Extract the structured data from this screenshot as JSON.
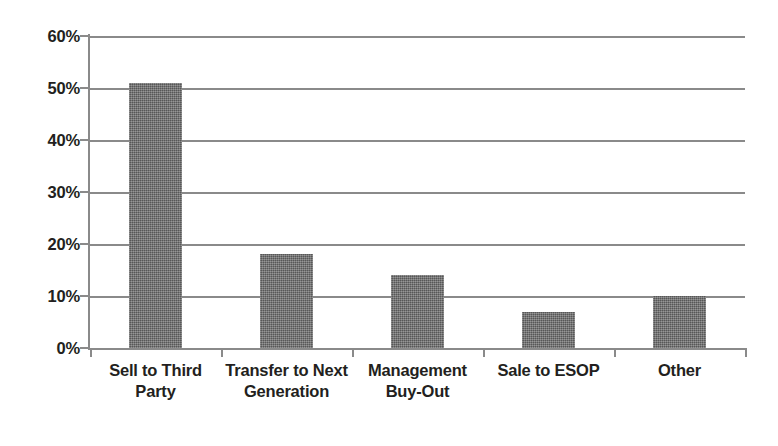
{
  "chart_data": {
    "type": "bar",
    "title": "",
    "subtitle": "",
    "xlabel": "",
    "ylabel": "",
    "categories": [
      "Sell to Third Party",
      "Transfer to Next Generation",
      "Management Buy-Out",
      "Sale to ESOP",
      "Other"
    ],
    "values": [
      51,
      18,
      14,
      7,
      10
    ],
    "ylim": [
      0,
      60
    ],
    "ytick_labels": [
      "60%",
      "50%",
      "40%",
      "30%",
      "20%",
      "10%",
      "0%"
    ],
    "ytick_values": [
      60,
      50,
      40,
      30,
      20,
      10,
      0
    ],
    "grid": true,
    "legend": "none",
    "value_format": "percent",
    "bar_color": "#6e6e6e",
    "grid_color": "#8a8a8a",
    "axis_color": "#8a8a8a",
    "text_color": "#231f20",
    "background_color": "#ffffff"
  }
}
